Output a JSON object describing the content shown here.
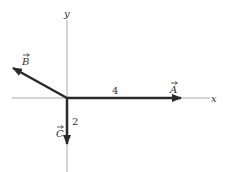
{
  "diagram": {
    "type": "vector-diagram",
    "axes": {
      "x_label": "x",
      "y_label": "y"
    },
    "vectors": [
      {
        "name": "A",
        "label": "A",
        "magnitude_label": "4",
        "direction": "positive x"
      },
      {
        "name": "B",
        "label": "B",
        "magnitude_label": "",
        "direction": "upper-left (second quadrant)"
      },
      {
        "name": "C",
        "label": "C",
        "magnitude_label": "2",
        "direction": "negative y"
      }
    ],
    "colors": {
      "axis": "#aaaaaa",
      "vector": "#2a2a2a",
      "text": "#333333"
    }
  }
}
